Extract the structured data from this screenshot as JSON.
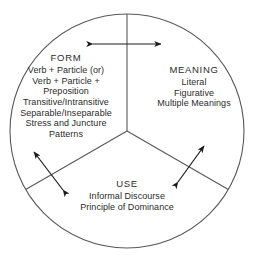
{
  "diagram": {
    "type": "three-sector-circle",
    "colors": {
      "stroke": "#4a4a4a",
      "text": "#2b2b2b",
      "arrow": "#1a1a1a",
      "background": "#ffffff"
    },
    "sectors": [
      {
        "id": "form",
        "title": "FORM",
        "lines": [
          "Verb + Particle (or)",
          "Verb + Particle +",
          "Preposition",
          "Transitive/Intransitive",
          "Separable/Inseparable",
          "Stress and Juncture",
          "Patterns"
        ]
      },
      {
        "id": "meaning",
        "title": "MEANING",
        "lines": [
          "Literal",
          "Figurative",
          "Multiple Meanings"
        ]
      },
      {
        "id": "use",
        "title": "USE",
        "lines": [
          "Informal Discourse",
          "Principle of Dominance"
        ]
      }
    ],
    "arrows": [
      {
        "id": "form-meaning-arrow",
        "label": "double-headed-arrow"
      },
      {
        "id": "form-use-arrow",
        "label": "double-headed-arrow"
      },
      {
        "id": "meaning-use-arrow",
        "label": "double-headed-arrow"
      }
    ]
  }
}
